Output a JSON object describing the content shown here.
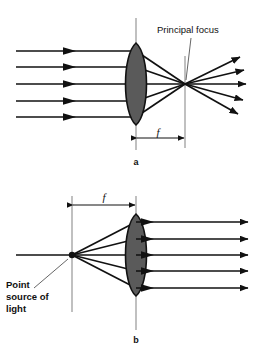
{
  "figure": {
    "colors": {
      "ray": "#111111",
      "lens_fill": "#5a5a5a",
      "lens_stroke": "#111111",
      "axis": "#8c8c8c",
      "text": "#111111",
      "background": "#ffffff"
    },
    "panels": [
      {
        "id": "a",
        "letter": "a",
        "caption": "Parallel rays converge to the principal focus",
        "labels": {
          "principal_focus": "Principal focus",
          "focal_length": "f"
        },
        "lens": {
          "center_x": 136,
          "center_y": 84,
          "half_height": 41,
          "half_width": 14
        },
        "focus_point": {
          "x": 185,
          "y": 84
        },
        "incoming_rays": [
          {
            "y": 51,
            "x_start": 16,
            "x_end": 136
          },
          {
            "y": 67,
            "x_start": 16,
            "x_end": 136
          },
          {
            "y": 84,
            "x_start": 16,
            "x_end": 136
          },
          {
            "y": 101,
            "x_start": 16,
            "x_end": 136
          },
          {
            "y": 117,
            "x_start": 16,
            "x_end": 136
          }
        ],
        "outgoing_rays": [
          {
            "x_end": 243,
            "y_end": 58
          },
          {
            "x_end": 247,
            "y_end": 70
          },
          {
            "x_end": 249,
            "y_end": 84
          },
          {
            "x_end": 246,
            "y_end": 100
          },
          {
            "x_end": 241,
            "y_end": 114
          }
        ],
        "focal_dimension": {
          "x_start": 136,
          "x_end": 185,
          "y": 138
        }
      },
      {
        "id": "b",
        "letter": "b",
        "caption": "Rays from a point source at the focus emerge parallel",
        "labels": {
          "point_source": [
            "Point",
            "source of",
            "light"
          ],
          "focal_length": "f"
        },
        "lens": {
          "center_x": 136,
          "center_y": 255,
          "half_height": 41,
          "half_width": 14
        },
        "source_point": {
          "x": 72,
          "y": 255
        },
        "outgoing_rays": [
          {
            "y": 222,
            "x_start": 136,
            "x_end": 251
          },
          {
            "y": 239,
            "x_start": 136,
            "x_end": 251
          },
          {
            "y": 255,
            "x_start": 136,
            "x_end": 251
          },
          {
            "y": 271,
            "x_start": 136,
            "x_end": 251
          },
          {
            "y": 288,
            "x_start": 136,
            "x_end": 251
          }
        ],
        "focal_dimension": {
          "x_start": 72,
          "x_end": 136,
          "y": 205
        }
      }
    ]
  }
}
